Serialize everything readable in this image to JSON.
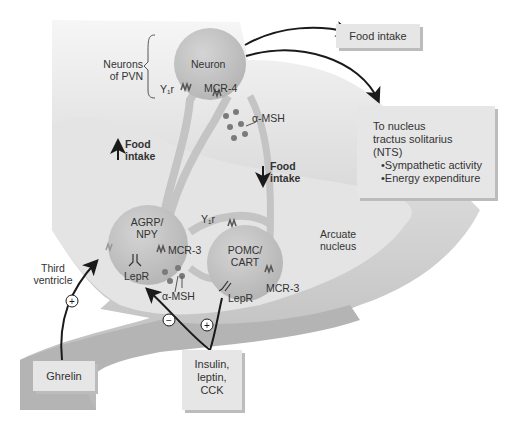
{
  "diagram": {
    "neurons": {
      "pvn_neuron": "Neuron",
      "agrp_npy": "AGRP/\nNPY",
      "pomc_cart": "POMC/\nCART"
    },
    "region_labels": {
      "neurons_of_pvn_line1": "Neurons",
      "neurons_of_pvn_line2": "of PVN",
      "arcuate_line1": "Arcuate",
      "arcuate_line2": "nucleus",
      "third_ventricle_line1": "Third",
      "third_ventricle_line2": "ventricle"
    },
    "receptors": {
      "y1r_pvn": "Y₁r",
      "mcr4": "MCR-4",
      "y1r_pomc": "Y₁r",
      "mcr3_agrp": "MCR-3",
      "mcr3_pomc": "MCR-3",
      "lepr_agrp": "LepR",
      "lepr_pomc": "LepR"
    },
    "ligands": {
      "alpha_msh_top": "α-MSH",
      "alpha_msh_bottom": "α-MSH"
    },
    "effects": {
      "increase_food_line1": "Food",
      "increase_food_line2": "intake",
      "decrease_food_line1": "Food",
      "decrease_food_line2": "intake"
    },
    "boxes": {
      "food_intake": "Food intake",
      "nts_line1": "To nucleus",
      "nts_line2": "tractus solitarius",
      "nts_line3": "(NTS)",
      "nts_bullet1": "•Sympathetic activity",
      "nts_bullet2": "•Energy expenditure",
      "ghrelin": "Ghrelin",
      "signals_line1": "Insulin,",
      "signals_line2": "leptin,",
      "signals_line3": "CCK"
    },
    "signs": {
      "ghrelin_sign": "+",
      "agrp_inhibit": "−",
      "pomc_stimulate": "+"
    },
    "colors": {
      "background": "#ffffff",
      "hypothalamus_light": "#e8e8e8",
      "hypothalamus_dark": "#bdbdbd",
      "arcuate": "#e2e2e2",
      "neuron_body": "#c4c4c4",
      "box": "#e6e6e6",
      "arrow": "#1a1a1a"
    }
  }
}
